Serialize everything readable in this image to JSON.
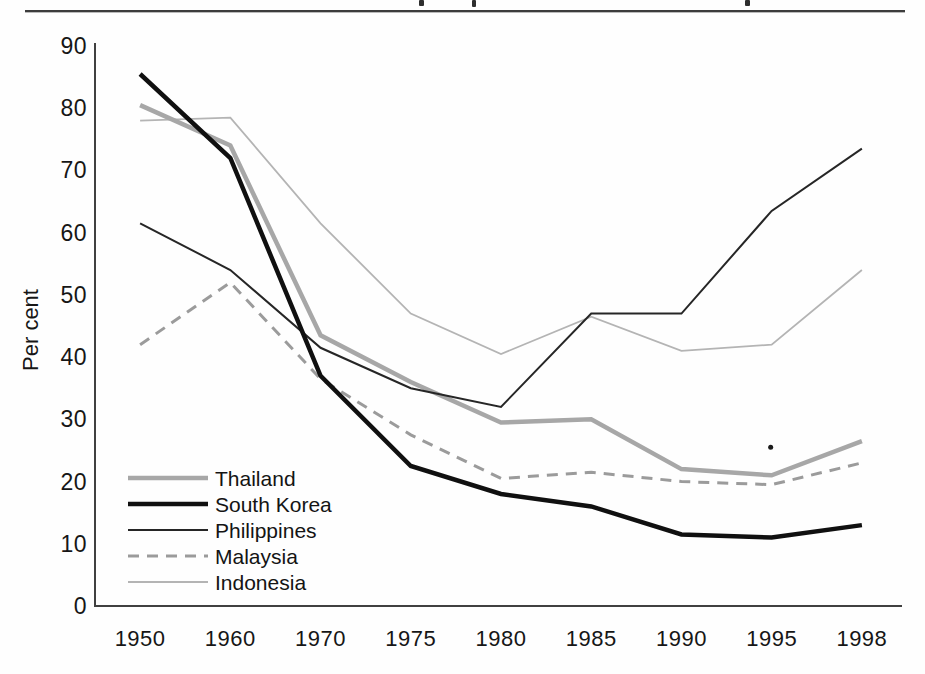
{
  "page": {
    "background_color": "#fefefe",
    "top_rule_color": "#3c3c3c",
    "axis_color": "#404040",
    "text_color": "#161616"
  },
  "chart_data": {
    "type": "line",
    "title": "",
    "xlabel": "",
    "ylabel": "Per cent",
    "categories": [
      "1950",
      "1960",
      "1970",
      "1975",
      "1980",
      "1985",
      "1990",
      "1995",
      "1998"
    ],
    "ylim": [
      0,
      90
    ],
    "yticks": [
      0,
      10,
      20,
      30,
      40,
      50,
      60,
      70,
      80,
      90
    ],
    "grid": false,
    "legend_position": "inside-bottom-left",
    "series": [
      {
        "name": "Thailand",
        "values": [
          80.5,
          74,
          43.5,
          36,
          29.5,
          30,
          22,
          21,
          26.5
        ],
        "color": "#a7a7a7",
        "width": 4.5,
        "dash": null
      },
      {
        "name": "South Korea",
        "values": [
          85.5,
          72,
          37,
          22.5,
          18,
          16,
          11.5,
          11,
          13
        ],
        "color": "#101010",
        "width": 4.5,
        "dash": null
      },
      {
        "name": "Philippines",
        "values": [
          61.5,
          54,
          41.5,
          35,
          32,
          47,
          47,
          63.5,
          73.5
        ],
        "color": "#262626",
        "width": 2,
        "dash": null
      },
      {
        "name": "Malaysia",
        "values": [
          42,
          52,
          36.5,
          27.5,
          20.5,
          21.5,
          20,
          19.5,
          23
        ],
        "color": "#9b9b9b",
        "width": 3,
        "dash": "11,8"
      },
      {
        "name": "Indonesia",
        "values": [
          78,
          78.5,
          61.5,
          47,
          40.5,
          46.5,
          41,
          42,
          54
        ],
        "color": "#b4b4b4",
        "width": 1.8,
        "dash": null
      }
    ],
    "draw_order": [
      "Indonesia",
      "Malaysia",
      "Thailand",
      "Philippines",
      "South Korea"
    ],
    "stray_mark": {
      "near_category": "1995",
      "approx_value": 25.5
    }
  }
}
